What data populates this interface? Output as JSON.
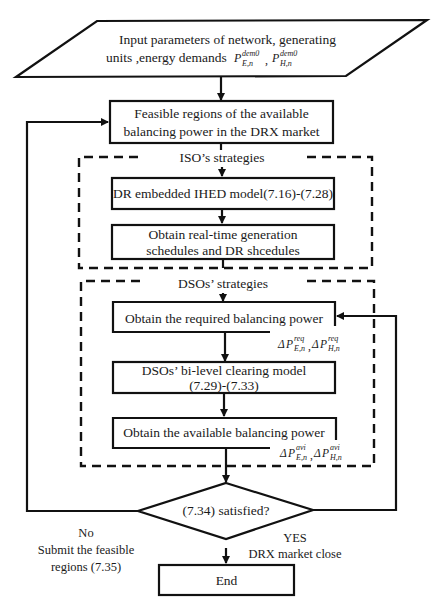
{
  "diagram": {
    "type": "flowchart",
    "nodes": {
      "input": {
        "shape": "parallelogram",
        "line1": "Input parameters of network, generating",
        "line2": "units ,energy demands",
        "math1_base": "P",
        "math1_sup": "dem0",
        "math1_sub": "E,n",
        "math_sep": ",",
        "math2_base": "P",
        "math2_sup": "dem0",
        "math2_sub": "H,n"
      },
      "feasible": {
        "shape": "rectangle",
        "line1": "Feasible regions of the available",
        "line2": "balancing power in the DRX market"
      },
      "iso_group": {
        "shape": "dashed-group",
        "label": "ISO’s strategies"
      },
      "dr_model": {
        "shape": "rectangle",
        "label": "DR embedded IHED model(7.16)-(7.28)"
      },
      "obtain_schedules": {
        "shape": "rectangle",
        "line1": "Obtain real-time generation",
        "line2": "schedules and DR shcedules"
      },
      "dso_group": {
        "shape": "dashed-group",
        "label": "DSOs’ strategies"
      },
      "required_power": {
        "shape": "rectangle",
        "label": "Obtain the required balancing power",
        "annotation": {
          "delta": "Δ",
          "base": "P",
          "sup": "req",
          "sub1": "E,n",
          "sep": ",",
          "sub2": "H,n"
        }
      },
      "bilevel": {
        "shape": "rectangle",
        "line1": "DSOs’ bi-level clearing model",
        "line2": "(7.29)-(7.33)"
      },
      "available_power": {
        "shape": "rectangle",
        "label": "Obtain the available balancing power",
        "annotation": {
          "delta": "Δ",
          "base": "P",
          "sup": "avi",
          "sub1": "E,n",
          "sep": ",",
          "sub2": "H,n"
        }
      },
      "decision": {
        "shape": "diamond",
        "label": "(7.34) satisfied?"
      },
      "end": {
        "shape": "rectangle",
        "label": "End"
      }
    },
    "edge_labels": {
      "no_line1": "No",
      "no_line2": "Submit the feasible",
      "no_line3": "regions (7.35)",
      "yes_line1": "YES",
      "yes_line2": "DRX market close"
    },
    "colors": {
      "stroke": "#111111",
      "text": "#1a1a1a",
      "background": "#ffffff"
    }
  }
}
